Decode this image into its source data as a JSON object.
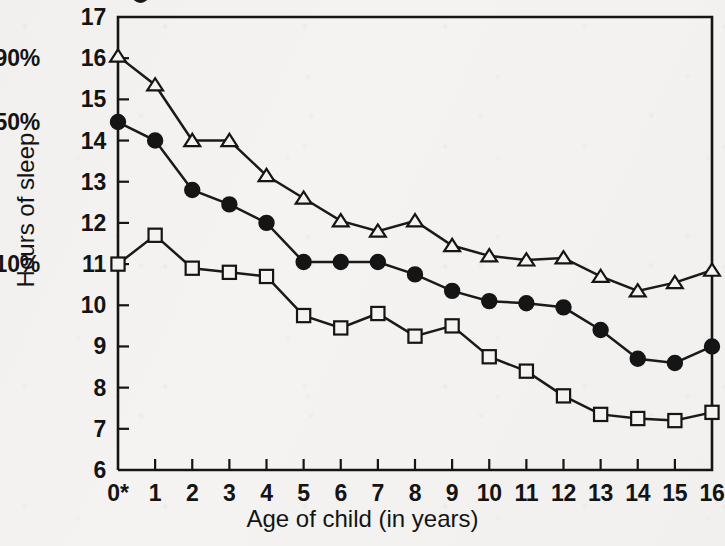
{
  "figure": {
    "background_color": "#f4f3f1",
    "ink_color": "#151515"
  },
  "axis_titles": {
    "y": "Hours of sleep",
    "x": "Age of child  (in years)"
  },
  "y_axis": {
    "ticks": [
      "17",
      "16",
      "15",
      "14",
      "13",
      "12",
      "11",
      "10",
      "9",
      "8",
      "7",
      "6"
    ],
    "min": 6,
    "max": 17,
    "percentile_labels": [
      {
        "text": "90%",
        "value": 16.0
      },
      {
        "text": "50%",
        "value": 14.45
      },
      {
        "text": "10%",
        "value": 11.0
      }
    ]
  },
  "x_axis": {
    "ticks": [
      "0*",
      "1",
      "2",
      "3",
      "4",
      "5",
      "6",
      "7",
      "8",
      "9",
      "10",
      "11",
      "12",
      "13",
      "14",
      "15",
      "16"
    ],
    "min": 0,
    "max": 16
  },
  "chart_data": {
    "type": "line",
    "title": "",
    "xlabel": "Age of child  (in years)",
    "ylabel": "Hours of sleep",
    "xlim": [
      0,
      16
    ],
    "ylim": [
      6,
      17
    ],
    "grid": false,
    "legend": "none",
    "x": [
      0,
      1,
      2,
      3,
      4,
      5,
      6,
      7,
      8,
      9,
      10,
      11,
      12,
      13,
      14,
      15,
      16
    ],
    "series": [
      {
        "name": "90th percentile",
        "marker": "triangle-open",
        "percentile_label": "90%",
        "values": [
          16.05,
          15.35,
          14.0,
          14.0,
          13.15,
          12.6,
          12.05,
          11.8,
          12.05,
          11.45,
          11.2,
          11.1,
          11.15,
          10.7,
          10.35,
          10.55,
          10.85
        ]
      },
      {
        "name": "50th percentile",
        "marker": "circle-filled",
        "percentile_label": "50%",
        "values": [
          14.45,
          14.0,
          12.8,
          12.45,
          12.0,
          11.05,
          11.05,
          11.05,
          10.75,
          10.35,
          10.1,
          10.05,
          9.95,
          9.4,
          8.7,
          8.6,
          9.0
        ]
      },
      {
        "name": "10th percentile",
        "marker": "square-open",
        "percentile_label": "10%",
        "values": [
          11.0,
          11.7,
          10.9,
          10.8,
          10.7,
          9.75,
          9.45,
          9.8,
          9.25,
          9.5,
          8.75,
          8.4,
          7.8,
          7.35,
          7.25,
          7.2,
          7.4
        ]
      }
    ]
  }
}
